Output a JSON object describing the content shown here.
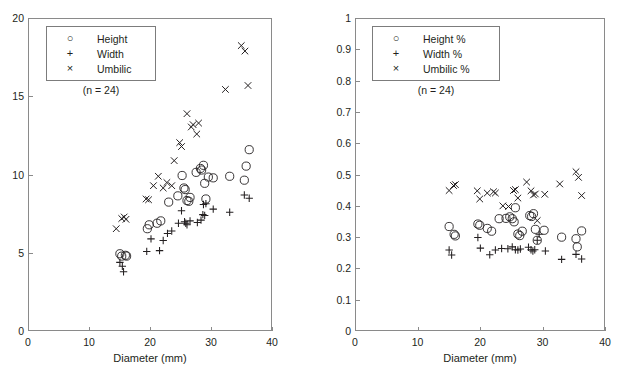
{
  "figure": {
    "background": "#ffffff",
    "marker_color": "#231f20",
    "axis_color": "#8a8a8a"
  },
  "chart_data": [
    {
      "id": "left",
      "type": "scatter",
      "title": "",
      "xlabel": "Diameter (mm)",
      "ylabel": "",
      "xlim": [
        0,
        40
      ],
      "ylim": [
        0,
        20
      ],
      "xticks": [
        0,
        10,
        20,
        30,
        40
      ],
      "yticks": [
        0,
        5,
        10,
        15,
        20
      ],
      "xtick_labels": [
        "0",
        "10",
        "20",
        "30",
        "40"
      ],
      "ytick_labels": [
        "0",
        "5",
        "10",
        "15",
        "20"
      ],
      "grid": false,
      "legend_position": "top-left",
      "annotation": "(n = 24)",
      "series": [
        {
          "name": "Height",
          "marker": "circle",
          "points": [
            [
              14.9,
              5.0
            ],
            [
              15.2,
              4.85
            ],
            [
              15.8,
              4.9
            ],
            [
              16.0,
              4.85
            ],
            [
              19.4,
              6.6
            ],
            [
              19.7,
              6.85
            ],
            [
              21.0,
              6.95
            ],
            [
              21.6,
              7.1
            ],
            [
              22.9,
              8.3
            ],
            [
              24.4,
              8.7
            ],
            [
              25.1,
              10.0
            ],
            [
              25.4,
              9.2
            ],
            [
              25.6,
              9.1
            ],
            [
              25.9,
              8.4
            ],
            [
              26.2,
              8.35
            ],
            [
              26.4,
              8.6
            ],
            [
              27.4,
              10.2
            ],
            [
              28.1,
              10.45
            ],
            [
              28.3,
              10.35
            ],
            [
              28.6,
              10.65
            ],
            [
              28.8,
              9.5
            ],
            [
              29.0,
              8.5
            ],
            [
              29.4,
              9.9
            ],
            [
              30.2,
              9.85
            ],
            [
              32.9,
              9.95
            ],
            [
              35.3,
              9.7
            ],
            [
              35.6,
              10.6
            ],
            [
              36.1,
              11.65
            ]
          ]
        },
        {
          "name": "Width",
          "marker": "plus",
          "points": [
            [
              14.9,
              4.45
            ],
            [
              15.3,
              4.2
            ],
            [
              15.5,
              3.85
            ],
            [
              19.3,
              5.15
            ],
            [
              20.0,
              5.95
            ],
            [
              21.4,
              5.2
            ],
            [
              22.0,
              5.85
            ],
            [
              22.7,
              6.3
            ],
            [
              23.4,
              6.45
            ],
            [
              24.5,
              6.95
            ],
            [
              25.0,
              7.75
            ],
            [
              25.5,
              7.05
            ],
            [
              25.7,
              6.95
            ],
            [
              25.9,
              6.85
            ],
            [
              26.4,
              7.1
            ],
            [
              27.6,
              7.0
            ],
            [
              28.2,
              7.15
            ],
            [
              28.5,
              7.5
            ],
            [
              28.6,
              8.15
            ],
            [
              28.8,
              7.45
            ],
            [
              29.0,
              8.2
            ],
            [
              30.2,
              7.85
            ],
            [
              32.9,
              7.65
            ],
            [
              35.3,
              8.75
            ],
            [
              36.1,
              8.55
            ]
          ]
        },
        {
          "name": "Umbilic",
          "marker": "cross",
          "points": [
            [
              14.3,
              6.6
            ],
            [
              15.2,
              7.25
            ],
            [
              15.6,
              7.35
            ],
            [
              15.9,
              7.2
            ],
            [
              19.2,
              8.5
            ],
            [
              19.6,
              8.45
            ],
            [
              20.4,
              9.35
            ],
            [
              21.2,
              9.95
            ],
            [
              22.0,
              9.2
            ],
            [
              22.6,
              9.55
            ],
            [
              23.4,
              9.35
            ],
            [
              23.8,
              10.95
            ],
            [
              24.7,
              12.1
            ],
            [
              25.0,
              11.85
            ],
            [
              25.9,
              13.95
            ],
            [
              26.6,
              13.1
            ],
            [
              26.9,
              13.25
            ],
            [
              27.5,
              12.65
            ],
            [
              27.8,
              13.35
            ],
            [
              32.2,
              15.5
            ],
            [
              34.8,
              18.3
            ],
            [
              35.4,
              17.95
            ],
            [
              35.9,
              15.75
            ]
          ]
        }
      ]
    },
    {
      "id": "right",
      "type": "scatter",
      "title": "",
      "xlabel": "Diameter (mm)",
      "ylabel": "",
      "xlim": [
        0,
        40
      ],
      "ylim": [
        0,
        1
      ],
      "xticks": [
        0,
        10,
        20,
        30,
        40
      ],
      "yticks": [
        0,
        0.1,
        0.2,
        0.3,
        0.4,
        0.5,
        0.6,
        0.7,
        0.8,
        0.9,
        1
      ],
      "xtick_labels": [
        "0",
        "10",
        "20",
        "30",
        "40",
        "0"
      ],
      "ytick_labels": [
        "0",
        "0.1",
        "0.2",
        "0.3",
        "0.4",
        "0.5",
        "0.6",
        "0.7",
        "0.8",
        "0.9",
        "1"
      ],
      "grid": false,
      "legend_position": "top-left",
      "annotation": "(n = 24)",
      "series": [
        {
          "name": "Height %",
          "marker": "circle",
          "points": [
            [
              14.9,
              0.337
            ],
            [
              15.7,
              0.312
            ],
            [
              15.9,
              0.307
            ],
            [
              19.5,
              0.345
            ],
            [
              19.8,
              0.341
            ],
            [
              21.0,
              0.331
            ],
            [
              21.7,
              0.322
            ],
            [
              22.9,
              0.362
            ],
            [
              24.0,
              0.363
            ],
            [
              24.6,
              0.368
            ],
            [
              25.0,
              0.362
            ],
            [
              25.3,
              0.352
            ],
            [
              25.5,
              0.397
            ],
            [
              25.9,
              0.313
            ],
            [
              26.2,
              0.308
            ],
            [
              26.6,
              0.322
            ],
            [
              27.8,
              0.372
            ],
            [
              28.1,
              0.369
            ],
            [
              28.4,
              0.378
            ],
            [
              28.7,
              0.328
            ],
            [
              29.0,
              0.293
            ],
            [
              30.1,
              0.325
            ],
            [
              32.9,
              0.303
            ],
            [
              35.2,
              0.298
            ],
            [
              35.4,
              0.272
            ],
            [
              36.1,
              0.323
            ]
          ]
        },
        {
          "name": "Width %",
          "marker": "plus",
          "points": [
            [
              14.9,
              0.262
            ],
            [
              15.3,
              0.246
            ],
            [
              19.5,
              0.302
            ],
            [
              19.9,
              0.268
            ],
            [
              21.4,
              0.247
            ],
            [
              22.3,
              0.262
            ],
            [
              23.3,
              0.267
            ],
            [
              24.3,
              0.266
            ],
            [
              25.0,
              0.272
            ],
            [
              25.5,
              0.263
            ],
            [
              25.9,
              0.262
            ],
            [
              26.3,
              0.265
            ],
            [
              27.6,
              0.271
            ],
            [
              28.0,
              0.263
            ],
            [
              28.3,
              0.259
            ],
            [
              28.6,
              0.263
            ],
            [
              29.0,
              0.293
            ],
            [
              29.3,
              0.312
            ],
            [
              30.3,
              0.259
            ],
            [
              32.9,
              0.232
            ],
            [
              35.2,
              0.248
            ],
            [
              36.1,
              0.233
            ]
          ]
        },
        {
          "name": "Umbilic %",
          "marker": "cross",
          "points": [
            [
              14.9,
              0.452
            ],
            [
              15.6,
              0.468
            ],
            [
              15.9,
              0.471
            ],
            [
              19.4,
              0.451
            ],
            [
              19.8,
              0.425
            ],
            [
              21.0,
              0.444
            ],
            [
              22.0,
              0.448
            ],
            [
              22.3,
              0.444
            ],
            [
              23.5,
              0.403
            ],
            [
              24.4,
              0.401
            ],
            [
              25.2,
              0.452
            ],
            [
              25.5,
              0.455
            ],
            [
              25.9,
              0.428
            ],
            [
              27.3,
              0.479
            ],
            [
              28.0,
              0.451
            ],
            [
              28.4,
              0.438
            ],
            [
              28.7,
              0.441
            ],
            [
              29.0,
              0.356
            ],
            [
              30.2,
              0.44
            ],
            [
              32.6,
              0.473
            ],
            [
              35.2,
              0.512
            ],
            [
              35.6,
              0.494
            ],
            [
              36.1,
              0.436
            ]
          ]
        }
      ]
    }
  ],
  "panels": {
    "left": {
      "legend": {
        "items": [
          {
            "glyph": "circle-marker-icon",
            "symbol": "○",
            "label": "Height"
          },
          {
            "glyph": "plus-marker-icon",
            "symbol": "+",
            "label": "Width"
          },
          {
            "glyph": "cross-marker-icon",
            "symbol": "×",
            "label": "Umbilic"
          }
        ],
        "note": "(n = 24)"
      },
      "xlabel": "Diameter (mm)",
      "xtick_labels": [
        "0",
        "10",
        "20",
        "30",
        "40"
      ],
      "ytick_labels": [
        "20",
        "15",
        "10",
        "5",
        "0"
      ]
    },
    "right": {
      "legend": {
        "items": [
          {
            "glyph": "circle-marker-icon",
            "symbol": "○",
            "label": "Height %"
          },
          {
            "glyph": "plus-marker-icon",
            "symbol": "+",
            "label": "Width %"
          },
          {
            "glyph": "cross-marker-icon",
            "symbol": "×",
            "label": "Umbilic %"
          }
        ],
        "note": "(n = 24)"
      },
      "xlabel": "Diameter (mm)",
      "xtick_labels": [
        "0",
        "10",
        "20",
        "30",
        "40"
      ],
      "ytick_labels": [
        "1",
        "0.9",
        "0.8",
        "0.7",
        "0.6",
        "0.5",
        "0.4",
        "0.3",
        "0.2",
        "0.1",
        "0"
      ]
    }
  }
}
